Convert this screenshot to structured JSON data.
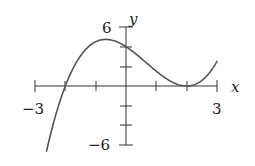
{
  "chart_data": {
    "type": "line",
    "title": "",
    "xlabel": "x",
    "ylabel": "y",
    "xlim": [
      -3,
      3
    ],
    "ylim": [
      -6,
      6
    ],
    "x_tick_labels": [
      "-3",
      "3"
    ],
    "y_tick_labels": [
      "6",
      "-6"
    ],
    "x_ticks": [
      -3,
      -2,
      -1,
      0,
      1,
      2,
      3
    ],
    "y_ticks": [
      -6,
      -4,
      -2,
      0,
      2,
      4,
      6
    ],
    "grid": false,
    "legend": null,
    "series": [
      {
        "name": "f(x)",
        "description": "cubic with root at x=-2 and double root at x=2, approx f(x)=(x+2)(x-2)^2/2",
        "x": [
          -2.62,
          -2.5,
          -2.0,
          -1.5,
          -1.0,
          -0.67,
          0.0,
          0.5,
          1.0,
          1.5,
          2.0,
          2.5,
          3.0
        ],
        "values": [
          -6.0,
          -4.05,
          0.0,
          3.06,
          4.5,
          4.74,
          4.0,
          3.13,
          1.5,
          0.44,
          0.0,
          0.56,
          2.5
        ]
      }
    ],
    "color": "#555555"
  },
  "labels": {
    "x_axis": "x",
    "y_axis": "y",
    "x_min": "−3",
    "x_max": "3",
    "y_max": "6",
    "y_min": "−6"
  }
}
